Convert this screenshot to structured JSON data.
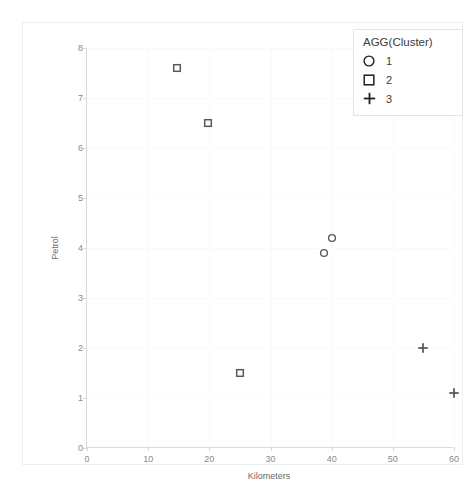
{
  "chart_data": {
    "type": "scatter",
    "title": "",
    "xlabel": "Kilometers",
    "ylabel": "Petrol",
    "xlim": [
      0,
      60
    ],
    "ylim": [
      0,
      8
    ],
    "xticks": [
      0,
      10,
      20,
      30,
      40,
      50,
      60
    ],
    "yticks": [
      0,
      1,
      2,
      3,
      4,
      5,
      6,
      7,
      8
    ],
    "grid": true,
    "legend": {
      "title": "AGG(Cluster)",
      "position": "top-right",
      "entries": [
        {
          "label": "1",
          "marker": "circle"
        },
        {
          "label": "2",
          "marker": "square"
        },
        {
          "label": "3",
          "marker": "plus"
        }
      ]
    },
    "series": [
      {
        "name": "1",
        "marker": "circle",
        "color": "#5a5a5a",
        "points": [
          {
            "x": 40.0,
            "y": 4.2
          },
          {
            "x": 38.7,
            "y": 3.9
          }
        ]
      },
      {
        "name": "2",
        "marker": "square",
        "color": "#5a5a5a",
        "points": [
          {
            "x": 14.7,
            "y": 7.6
          },
          {
            "x": 19.8,
            "y": 6.5
          },
          {
            "x": 25.0,
            "y": 1.5
          }
        ]
      },
      {
        "name": "3",
        "marker": "plus",
        "color": "#5a5a5a",
        "points": [
          {
            "x": 55.0,
            "y": 2.0
          },
          {
            "x": 60.0,
            "y": 1.1
          }
        ]
      }
    ]
  },
  "colors": {
    "marker": "#5a5a5a",
    "axis": "#d9d9d9",
    "grid": "#fafafa",
    "tick_text": "#8a8a8a",
    "axis_title": "#6b6b6b",
    "legend_text": "#3c3c3c",
    "container_border": "#eceff1",
    "background": "#ffffff"
  }
}
